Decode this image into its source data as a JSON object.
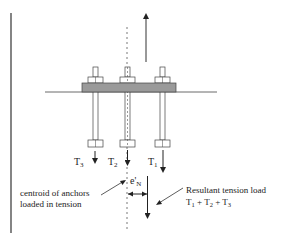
{
  "diagram": {
    "colors": {
      "line": "#333333",
      "plate_fill": "#9a9a9a",
      "background": "#ffffff"
    },
    "labels": {
      "t3_main": "T",
      "t3_sub": "3",
      "t2_main": "T",
      "t2_sub": "2",
      "t1_main": "T",
      "t1_sub": "1",
      "eccentricity_main": "e'",
      "eccentricity_sub": "N",
      "centroid_line1": "centroid of anchors",
      "centroid_line2": "loaded in tension",
      "resultant_line1": "Resultant tension load",
      "resultant_line2_t1": "T",
      "resultant_line2_t1_sub": "1",
      "resultant_line2_plus1": " + T",
      "resultant_line2_t2_sub": "2",
      "resultant_line2_plus2": " + T",
      "resultant_line2_t3_sub": "3"
    }
  }
}
